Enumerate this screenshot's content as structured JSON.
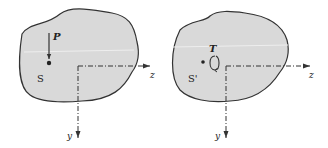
{
  "figure": {
    "panels": [
      {
        "id": "left",
        "region_label": "S",
        "load_label": "P",
        "load_type": "point-force-arrow",
        "axis_z_label": "z",
        "axis_y_label": "y"
      },
      {
        "id": "right",
        "region_label": "S'",
        "load_label": "T",
        "load_type": "twisting-moment",
        "axis_z_label": "z",
        "axis_y_label": "y"
      }
    ],
    "colors": {
      "region_fill": "#d9d9d9",
      "outline": "#333333",
      "axis": "#333333",
      "background": "#ffffff"
    }
  }
}
